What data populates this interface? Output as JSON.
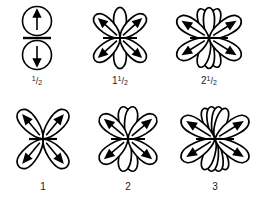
{
  "figure": {
    "type": "scientific-diagram",
    "background_color": "#ffffff",
    "stroke_color": "#000000",
    "rows": 2,
    "columns": 3
  },
  "cells": [
    {
      "id": "cell-half",
      "kind": "spin-circles",
      "label_whole": "",
      "label_numerator": "1",
      "label_slash": "/",
      "label_denominator": "2",
      "label_text": "1/2",
      "circles": 2,
      "arrows": [
        "up",
        "down"
      ],
      "divider": true,
      "diagonal_lobes": 0,
      "vertical_lobes": 0
    },
    {
      "id": "cell-one-half",
      "kind": "rosette",
      "label_whole": "1",
      "label_numerator": "1",
      "label_slash": "/",
      "label_denominator": "2",
      "label_text": "1 1/2",
      "diagonal_lobes": 4,
      "vertical_lobes": 2,
      "arrows": 4,
      "axis_line": true
    },
    {
      "id": "cell-two-half",
      "kind": "rosette",
      "label_whole": "2",
      "label_numerator": "1",
      "label_slash": "/",
      "label_denominator": "2",
      "label_text": "2 1/2",
      "diagonal_lobes": 4,
      "vertical_lobes": 6,
      "arrows": 4,
      "axis_line": true
    },
    {
      "id": "cell-one",
      "kind": "rosette",
      "label_whole": "1",
      "label_numerator": "",
      "label_slash": "",
      "label_denominator": "",
      "label_text": "1",
      "diagonal_lobes": 4,
      "vertical_lobes": 0,
      "arrows": 4,
      "axis_line": true
    },
    {
      "id": "cell-two",
      "kind": "rosette",
      "label_whole": "2",
      "label_numerator": "",
      "label_slash": "",
      "label_denominator": "",
      "label_text": "2",
      "diagonal_lobes": 4,
      "vertical_lobes": 2,
      "arrows": 4,
      "axis_line": true
    },
    {
      "id": "cell-three",
      "kind": "rosette",
      "label_whole": "3",
      "label_numerator": "",
      "label_slash": "",
      "label_denominator": "",
      "label_text": "3",
      "diagonal_lobes": 4,
      "vertical_lobes": 6,
      "arrows": 4,
      "axis_line": true
    }
  ]
}
